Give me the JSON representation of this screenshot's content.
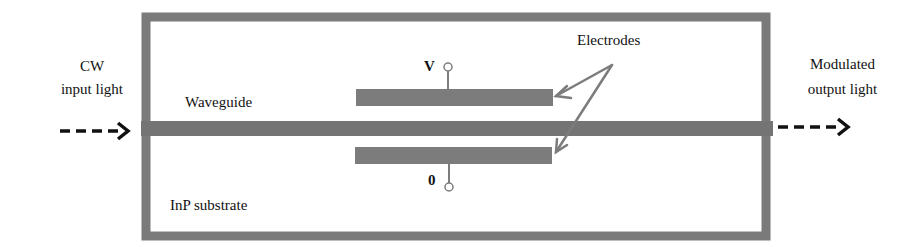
{
  "diagram": {
    "colors": {
      "structure": "#7a7a7a",
      "arrow": "#111111",
      "text": "#111111",
      "background": "#ffffff"
    },
    "labels": {
      "input_line1": "CW",
      "input_line2": "input light",
      "output_line1": "Modulated",
      "output_line2": "output light",
      "waveguide": "Waveguide",
      "substrate": "InP substrate",
      "electrodes": "Electrodes",
      "terminal_top": "V",
      "terminal_bottom": "0"
    },
    "components": [
      {
        "name": "InP substrate",
        "type": "rectangle-outline"
      },
      {
        "name": "Waveguide",
        "type": "bar"
      },
      {
        "name": "Top electrode",
        "type": "bar",
        "terminal": "V"
      },
      {
        "name": "Bottom electrode",
        "type": "bar",
        "terminal": "0"
      }
    ],
    "flows": [
      {
        "from": "CW input light",
        "to": "Waveguide",
        "style": "dashed-arrow"
      },
      {
        "from": "Waveguide",
        "to": "Modulated output light",
        "style": "dashed-arrow"
      },
      {
        "from": "Electrodes label",
        "to": "Top electrode",
        "style": "arrow"
      },
      {
        "from": "Electrodes label",
        "to": "Bottom electrode",
        "style": "arrow"
      }
    ]
  }
}
